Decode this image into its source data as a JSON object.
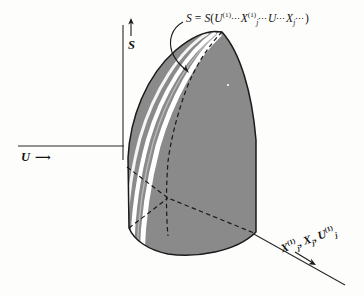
{
  "figure": {
    "type": "3d-surface-sketch",
    "background_color": "#fdfdfc",
    "surface_fill_color": "#8a8a8a",
    "surface_outline_color": "#1a1a1a",
    "highlight_stripe_color": "#ffffff",
    "dashed_curve_color": "#1a1a1a",
    "axis_color": "#2a2a2a"
  },
  "axes": {
    "vertical": {
      "name": "S",
      "label": "S",
      "arrow": "up-arrow-icon",
      "description": "entropy axis pointing up"
    },
    "horizontal": {
      "name": "U",
      "label": "U",
      "arrow": "right-arrow-icon",
      "arrow_glyph": "⟶",
      "description": "internal energy axis pointing right"
    },
    "depth": {
      "name": "X-U-composite",
      "parts": [
        {
          "base": "X",
          "sub": "j",
          "sup": "(1)"
        },
        {
          "sep": ", "
        },
        {
          "base": "X",
          "sub": "j",
          "sup": ""
        },
        {
          "sep": ", "
        },
        {
          "base": "U",
          "sub": "j",
          "sup": "(1)"
        }
      ],
      "arrow": "down-right-arrow-icon",
      "rotation_deg": -19,
      "description": "extensive parameter axis going down-right into the page"
    }
  },
  "equation_label": {
    "name": "surface-equation",
    "lhs": "S",
    "equals": " = ",
    "fn": "S",
    "open": "(",
    "close": ")",
    "dots": "⋯",
    "terms": [
      {
        "base": "U",
        "sup": "(1)",
        "sub": ""
      },
      {
        "base": "X",
        "sup": "(1)",
        "sub": "j"
      },
      {
        "base": "U",
        "sup": "",
        "sub": ""
      },
      {
        "base": "X",
        "sup": "",
        "sub": "j"
      }
    ],
    "plain_text": "S = S(U(1)⋯Xj(1)⋯U⋯Xj⋯)"
  },
  "annotations": {
    "leader_arrow": {
      "name": "leader-arrow",
      "from": "equation label",
      "to": "surface upper edge",
      "style": "curved arrow"
    },
    "highlight_stripes": {
      "name": "highlight-stripes",
      "count": 2,
      "description": "white specular highlight bands along the left flank of the surface"
    },
    "dashed_outline": {
      "name": "dashed-ruling-curves",
      "description": "dashed curve along the surface crest and dashed ruling lines crossing on the face"
    }
  }
}
